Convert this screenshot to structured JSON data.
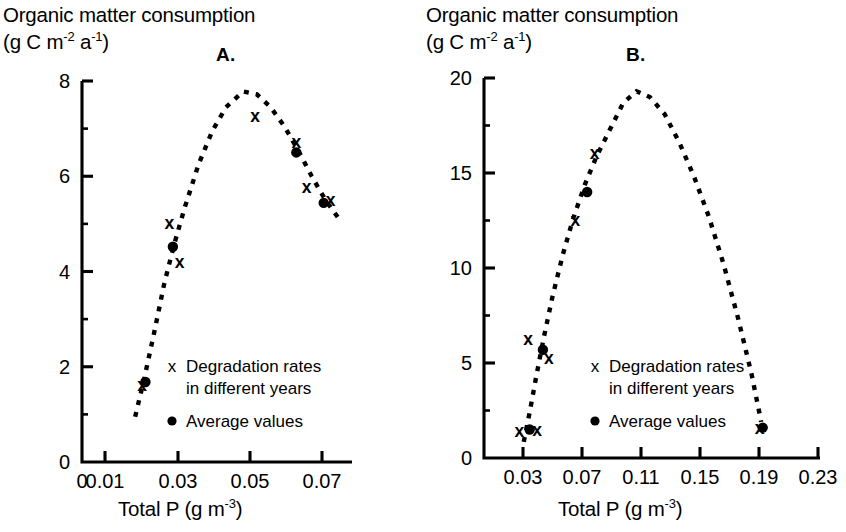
{
  "figure": {
    "background": "#ffffff",
    "ink_color": "#000000",
    "panels": [
      "A",
      "B"
    ]
  },
  "chart_data": [
    {
      "type": "scatter",
      "panel_label": "A.",
      "title": "Organic matter consumption (g C m-2 a-1)",
      "ylabel_line1": "Organic matter consumption",
      "ylabel_line2_prefix": "(g C m",
      "ylabel_line2_sup1": "-2",
      "ylabel_line2_mid": " a",
      "ylabel_line2_sup2": "-1",
      "ylabel_line2_suffix": ")",
      "xlabel_prefix": "Total P (g m",
      "xlabel_sup": "-3",
      "xlabel_suffix": ")",
      "xlim": [
        0.0,
        0.081
      ],
      "ylim": [
        0,
        8
      ],
      "xticks": [
        0,
        0.01,
        0.03,
        0.05,
        0.07
      ],
      "xticklabels": [
        "0",
        "0.01",
        "0.03",
        "0.05",
        "0.07"
      ],
      "yticks": [
        0,
        2,
        4,
        6,
        8
      ],
      "yticklabels": [
        "0",
        "2",
        "4",
        "6",
        "8"
      ],
      "grid": false,
      "series": [
        {
          "name": "Degradation rates in different years",
          "marker": "x",
          "points": [
            {
              "x": 0.0175,
              "y": 1.62
            },
            {
              "x": 0.0255,
              "y": 5.02
            },
            {
              "x": 0.0285,
              "y": 4.2
            },
            {
              "x": 0.0505,
              "y": 7.28
            },
            {
              "x": 0.0625,
              "y": 6.72
            },
            {
              "x": 0.0655,
              "y": 5.78
            },
            {
              "x": 0.0725,
              "y": 5.5
            }
          ]
        },
        {
          "name": "Average values",
          "marker": "dot",
          "points": [
            {
              "x": 0.0185,
              "y": 1.68
            },
            {
              "x": 0.0265,
              "y": 4.52
            },
            {
              "x": 0.0625,
              "y": 6.5
            },
            {
              "x": 0.0705,
              "y": 5.44
            }
          ]
        }
      ],
      "fit_curve": {
        "style": "dashed",
        "description": "dashed unimodal fitted curve peaking near 0.047",
        "points": [
          {
            "x": 0.0155,
            "y": 0.95
          },
          {
            "x": 0.018,
            "y": 1.7
          },
          {
            "x": 0.021,
            "y": 2.7
          },
          {
            "x": 0.024,
            "y": 3.75
          },
          {
            "x": 0.027,
            "y": 4.6
          },
          {
            "x": 0.03,
            "y": 5.35
          },
          {
            "x": 0.034,
            "y": 6.25
          },
          {
            "x": 0.038,
            "y": 6.95
          },
          {
            "x": 0.042,
            "y": 7.45
          },
          {
            "x": 0.047,
            "y": 7.78
          },
          {
            "x": 0.051,
            "y": 7.72
          },
          {
            "x": 0.055,
            "y": 7.45
          },
          {
            "x": 0.059,
            "y": 7.05
          },
          {
            "x": 0.063,
            "y": 6.55
          },
          {
            "x": 0.067,
            "y": 6.0
          },
          {
            "x": 0.071,
            "y": 5.5
          },
          {
            "x": 0.0755,
            "y": 5.05
          }
        ]
      },
      "legend": {
        "position": "inside-lower-right",
        "entries": [
          {
            "marker": "x",
            "line1": "Degradation rates",
            "line2": "in different years"
          },
          {
            "marker": "dot",
            "line1": "Average values",
            "line2": ""
          }
        ]
      }
    },
    {
      "type": "scatter",
      "panel_label": "B.",
      "title": "Organic matter consumption (g C m-2 a-1)",
      "ylabel_line1": "Organic matter consumption",
      "ylabel_line2_prefix": "(g C m",
      "ylabel_line2_sup1": "-2",
      "ylabel_line2_mid": " a",
      "ylabel_line2_sup2": "-1",
      "ylabel_line2_suffix": ")",
      "xlabel_prefix": "Total P (g m",
      "xlabel_sup": "-3",
      "xlabel_suffix": ")",
      "xlim": [
        0.012,
        0.245
      ],
      "ylim": [
        0,
        20
      ],
      "xticks": [
        0.03,
        0.07,
        0.11,
        0.15,
        0.19,
        0.23
      ],
      "xticklabels": [
        "0.03",
        "0.07",
        "0.11",
        "0.15",
        "0.19",
        "0.23"
      ],
      "yticks": [
        0,
        5,
        10,
        15,
        20
      ],
      "yticklabels": [
        "0",
        "5",
        "10",
        "15",
        "20"
      ],
      "grid": false,
      "series": [
        {
          "name": "Degradation rates in different years",
          "marker": "x",
          "points": [
            {
              "x": 0.0275,
              "y": 1.45
            },
            {
              "x": 0.0395,
              "y": 1.5
            },
            {
              "x": 0.0335,
              "y": 6.3
            },
            {
              "x": 0.0475,
              "y": 5.3
            },
            {
              "x": 0.0655,
              "y": 12.55
            },
            {
              "x": 0.0785,
              "y": 16.05
            },
            {
              "x": 0.1905,
              "y": 1.6
            }
          ]
        },
        {
          "name": "Average values",
          "marker": "dot",
          "points": [
            {
              "x": 0.0345,
              "y": 1.5
            },
            {
              "x": 0.0435,
              "y": 5.7
            },
            {
              "x": 0.0735,
              "y": 14.0
            },
            {
              "x": 0.1925,
              "y": 1.6
            }
          ]
        }
      ],
      "fit_curve": {
        "style": "dashed",
        "description": "dashed unimodal fitted curve peaking near 0.105",
        "points": [
          {
            "x": 0.0305,
            "y": 0.85
          },
          {
            "x": 0.0345,
            "y": 2.4
          },
          {
            "x": 0.039,
            "y": 4.3
          },
          {
            "x": 0.044,
            "y": 6.3
          },
          {
            "x": 0.05,
            "y": 8.5
          },
          {
            "x": 0.057,
            "y": 10.7
          },
          {
            "x": 0.064,
            "y": 12.6
          },
          {
            "x": 0.072,
            "y": 14.4
          },
          {
            "x": 0.08,
            "y": 15.9
          },
          {
            "x": 0.089,
            "y": 17.3
          },
          {
            "x": 0.098,
            "y": 18.7
          },
          {
            "x": 0.107,
            "y": 19.3
          },
          {
            "x": 0.116,
            "y": 19.0
          },
          {
            "x": 0.126,
            "y": 18.1
          },
          {
            "x": 0.136,
            "y": 16.6
          },
          {
            "x": 0.146,
            "y": 14.8
          },
          {
            "x": 0.156,
            "y": 12.7
          },
          {
            "x": 0.166,
            "y": 10.2
          },
          {
            "x": 0.176,
            "y": 7.3
          },
          {
            "x": 0.185,
            "y": 4.4
          },
          {
            "x": 0.1915,
            "y": 1.9
          }
        ]
      },
      "legend": {
        "position": "inside-lower-right",
        "entries": [
          {
            "marker": "x",
            "line1": "Degradation rates",
            "line2": "in different years"
          },
          {
            "marker": "dot",
            "line1": "Average values",
            "line2": ""
          }
        ]
      }
    }
  ]
}
